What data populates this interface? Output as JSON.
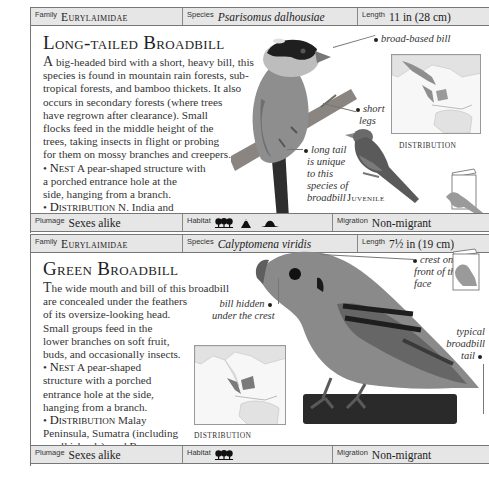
{
  "entries": [
    {
      "header": {
        "family_label": "Family",
        "family_value": "Eurylaimidae",
        "species_label": "Species",
        "species_value": "Psarisomus dalhousiae",
        "length_label": "Length",
        "length_value": "11 in (28 cm)"
      },
      "title": "Long-tailed Broadbill",
      "body_lines": [
        "big-headed bird with a short, heavy bill, this",
        "species is found in mountain rain forests, sub-",
        "tropical forests, and bamboo thickets. It also",
        "occurs in secondary forests (where trees",
        "have regrown after clearance). Small",
        "flocks feed in the middle height of the",
        "trees, taking insects in flight or probing",
        "for them on mossy branches and creepers."
      ],
      "body_initial": "A",
      "nest_label": "Nest",
      "nest_lines": [
        "A pear-shaped structure with",
        "a porched entrance hole at the",
        "side, hanging from a branch."
      ],
      "distribution_label": "Distribution",
      "distribution_lines": [
        "N. India and",
        "S. China to Sumatra and Borneo."
      ],
      "annotations": {
        "bill": "broad-based bill",
        "legs_1": "short",
        "legs_2": "legs",
        "tail_1": "long tail",
        "tail_2": "is unique",
        "tail_3": "to this",
        "tail_4": "species of",
        "tail_5": "broadbill"
      },
      "juvenile_label": "Juvenile",
      "map_label": "DISTRIBUTION",
      "footer": {
        "plumage_label": "Plumage",
        "plumage_value": "Sexes alike",
        "habitat_label": "Habitat",
        "habitat_icons": [
          "forest-icon",
          "mountain-icon",
          "hill-icon"
        ],
        "migration_label": "Migration",
        "migration_value": "Non-migrant"
      }
    },
    {
      "header": {
        "family_label": "Family",
        "family_value": "Eurylaimidae",
        "species_label": "Species",
        "species_value": "Calyptomena viridis",
        "length_label": "Length",
        "length_value": "7½ in (19 cm)"
      },
      "title": "Green Broadbill",
      "body_initial": "T",
      "body_lines": [
        "he wide mouth and bill of this broadbill",
        "are concealed under the feathers",
        "of its oversize-looking head.",
        "Small groups feed in the",
        "lower branches on soft fruit,",
        "buds, and occasionally insects."
      ],
      "nest_label": "Nest",
      "nest_lines": [
        "A pear-shaped",
        "structure with a porched",
        "entrance hole at the side,",
        "hanging from a branch."
      ],
      "distribution_label": "Distribution",
      "distribution_lines": [
        "Malay",
        "Peninsula, Sumatra (including",
        "small islands), and Borneo."
      ],
      "annotations": {
        "crest_1": "crest on the",
        "crest_2": "front of the",
        "crest_3": "face",
        "bill_1": "bill hidden",
        "bill_2": "under the crest",
        "tail_1": "typical",
        "tail_2": "broadbill",
        "tail_3": "tail"
      },
      "map_label": "DISTRIBUTION",
      "footer": {
        "plumage_label": "Plumage",
        "plumage_value": "Sexes alike",
        "habitat_label": "Habitat",
        "habitat_icons": [
          "forest-icon"
        ],
        "migration_label": "Migration",
        "migration_value": "Non-migrant"
      }
    }
  ]
}
